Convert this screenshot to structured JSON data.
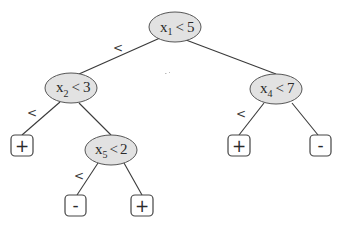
{
  "diagram": {
    "type": "decision-tree",
    "colors": {
      "node_fill": "#e2e2e2",
      "node_stroke": "#555555",
      "edge": "#3a3a3a",
      "leaf_stroke": "#444444"
    },
    "nodes": [
      {
        "id": "n1",
        "var": "x",
        "sub": "1",
        "op": "<",
        "value": "5"
      },
      {
        "id": "n2",
        "var": "x",
        "sub": "2",
        "op": "<",
        "value": "3"
      },
      {
        "id": "n4",
        "var": "x",
        "sub": "4",
        "op": "<",
        "value": "7"
      },
      {
        "id": "n5",
        "var": "x",
        "sub": "5",
        "op": "<",
        "value": "2"
      }
    ],
    "leaves": [
      {
        "id": "l1",
        "label": "+"
      },
      {
        "id": "l2",
        "label": "-"
      },
      {
        "id": "l3",
        "label": "+"
      },
      {
        "id": "l4",
        "label": "+"
      },
      {
        "id": "l5",
        "label": "-"
      }
    ],
    "edge_labels": [
      "<",
      "<",
      "<",
      "<"
    ],
    "edges": [
      {
        "from": "n1",
        "to": "n2",
        "label": "<"
      },
      {
        "from": "n1",
        "to": "n4"
      },
      {
        "from": "n2",
        "to": "l1",
        "label": "<"
      },
      {
        "from": "n2",
        "to": "n5"
      },
      {
        "from": "n5",
        "to": "l2",
        "label": "<"
      },
      {
        "from": "n5",
        "to": "l3"
      },
      {
        "from": "n4",
        "to": "l4",
        "label": "<"
      },
      {
        "from": "n4",
        "to": "l5"
      }
    ]
  }
}
